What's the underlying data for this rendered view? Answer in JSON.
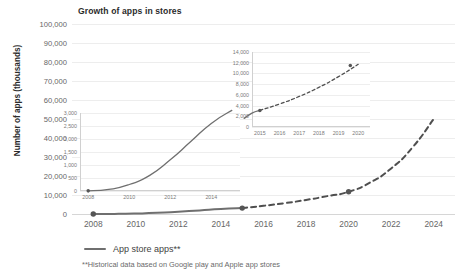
{
  "chart_data": {
    "type": "line",
    "title": "Growth of apps in stores",
    "xlabel": "",
    "ylabel": "Number of apps (thousands)",
    "xlim": [
      2007,
      2025
    ],
    "ylim": [
      0,
      100000
    ],
    "x_ticks": [
      "2008",
      "2010",
      "2012",
      "2014",
      "2016",
      "2018",
      "2020",
      "2022",
      "2024"
    ],
    "y_ticks": [
      "0",
      "10,000",
      "20,000",
      "30,000",
      "40,000",
      "50,000",
      "60,000",
      "70,000",
      "80,000",
      "90,000",
      "100,000"
    ],
    "grid": true,
    "legend_position": "bottom",
    "series": [
      {
        "name": "App store apps**",
        "style": "solid",
        "color": "#6f6f6f",
        "x": [
          2008,
          2009,
          2010,
          2011,
          2012,
          2013,
          2014,
          2015
        ],
        "values": [
          5,
          60,
          250,
          600,
          1200,
          1900,
          2600,
          3100
        ]
      },
      {
        "name": "App store apps** (projected)",
        "style": "dashed",
        "color": "#4f4f4f",
        "x": [
          2015,
          2016,
          2017,
          2018,
          2019,
          2020,
          2021,
          2022,
          2023,
          2024
        ],
        "values": [
          3100,
          4300,
          5700,
          7400,
          9400,
          11700,
          16500,
          24000,
          35000,
          50000
        ]
      }
    ],
    "markers": [
      {
        "x": 2008,
        "y": 5,
        "label": ""
      },
      {
        "x": 2015,
        "y": 3100,
        "label": ""
      },
      {
        "x": 2020,
        "y": 11700,
        "label": ""
      }
    ],
    "annotations": [
      "**Historical data based on Google play and Apple app stores"
    ],
    "insets": [
      {
        "name": "inset-2008-2014",
        "type": "line",
        "xlim": [
          2007.6,
          2015.4
        ],
        "ylim": [
          0,
          3000
        ],
        "x_ticks": [
          "2008",
          "2010",
          "2012",
          "2014"
        ],
        "y_ticks": [
          "0",
          "500",
          "1,000",
          "1,500",
          "2,000",
          "2,500",
          "3,000"
        ],
        "series": [
          {
            "name": "App store apps**",
            "style": "solid",
            "color": "#6f6f6f",
            "x": [
              2008,
              2009,
              2010,
              2011,
              2012,
              2013,
              2014,
              2015
            ],
            "values": [
              5,
              60,
              250,
              600,
              1200,
              1900,
              2600,
              3100
            ]
          }
        ],
        "markers": [
          {
            "x": 2008,
            "y": 5
          }
        ]
      },
      {
        "name": "inset-2015-2020",
        "type": "line",
        "xlim": [
          2014.6,
          2020.6
        ],
        "ylim": [
          0,
          14000
        ],
        "x_ticks": [
          "2015",
          "2016",
          "2017",
          "2018",
          "2019",
          "2020"
        ],
        "y_ticks": [
          "0",
          "2,000",
          "4,000",
          "6,000",
          "8,000",
          "10,000",
          "12,000",
          "14,000"
        ],
        "series": [
          {
            "name": "App store apps** historical",
            "style": "solid",
            "color": "#6f6f6f",
            "x": [
              2014.2,
              2014.6,
              2015
            ],
            "values": [
              1600,
              2600,
              3100
            ]
          },
          {
            "name": "App store apps** projected",
            "style": "dashed",
            "color": "#4f4f4f",
            "x": [
              2015,
              2016,
              2017,
              2018,
              2019,
              2020
            ],
            "values": [
              3100,
              4300,
              5700,
              7400,
              9400,
              11700
            ]
          }
        ],
        "markers": [
          {
            "x": 2015,
            "y": 3100
          },
          {
            "x": 2019.6,
            "y": 11500
          }
        ]
      }
    ]
  },
  "legend": {
    "label": "App store apps**"
  },
  "footnote": {
    "text": "**Historical data based on Google play and Apple app stores"
  },
  "colors": {
    "line": "#6f6f6f",
    "grid": "#ededed",
    "text": "#3f3f3f",
    "tick": "#666666"
  }
}
